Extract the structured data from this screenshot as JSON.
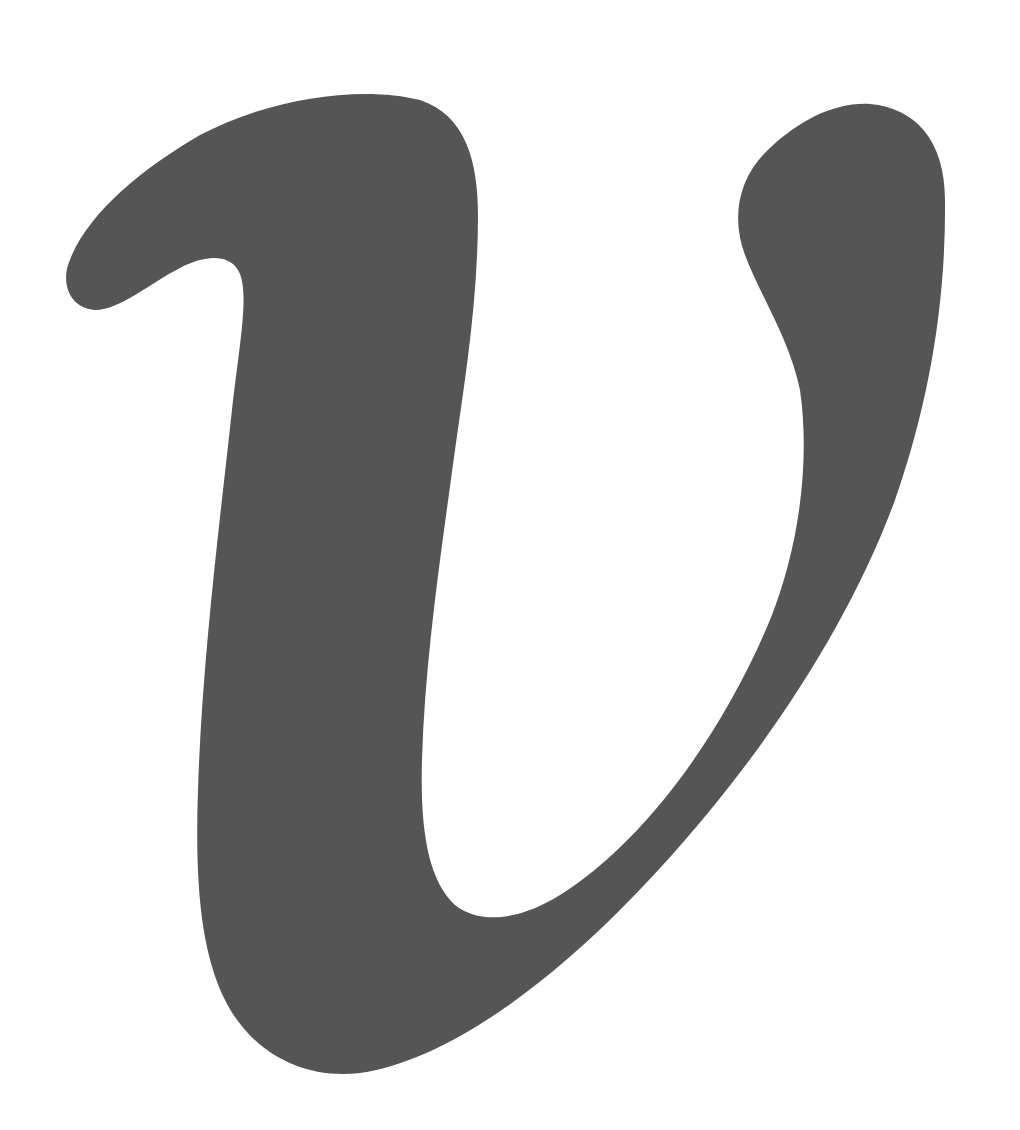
{
  "figure": {
    "glyph": "v",
    "fill_color": "#555555",
    "background_color": "#ffffff"
  }
}
